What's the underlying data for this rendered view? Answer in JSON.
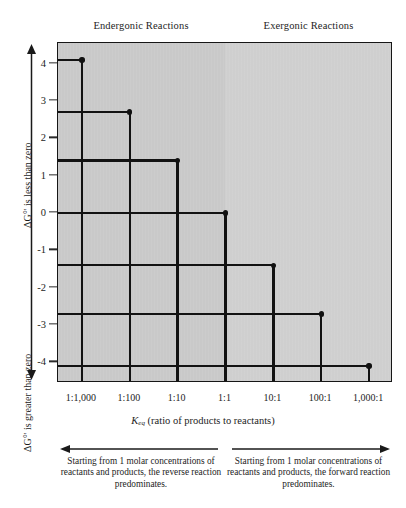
{
  "figure": {
    "region_headers": {
      "left": "Endergonic Reactions",
      "right": "Exergonic Reactions"
    },
    "y_axis": {
      "caption_upper": "ΔG°' is less than zero",
      "caption_lower": "ΔG°' is greater than zero"
    },
    "x_axis": {
      "title_symbol": "K",
      "title_subscript": "eq",
      "title_rest": " (ratio of products to reactants)"
    },
    "bottom_captions": {
      "left": "Starting from 1 molar concentrations of reactants and products, the reverse reaction predominates.",
      "right": "Starting from 1 molar concentrations of reactants and products, the forward reaction predominates."
    },
    "colors": {
      "plot_fill_left": "#c9c9c9",
      "plot_fill_right": "#cfcfcf",
      "line": "#121212",
      "frame": "#161616",
      "text": "#1d1d1d"
    }
  },
  "chart_data": {
    "type": "line",
    "title": "",
    "subtitle": "",
    "xlabel": "Keq (ratio of products to reactants)",
    "ylabel": "ΔG°'",
    "grid": false,
    "legend_position": "none",
    "step_style": "staircase",
    "x_categories": [
      "1:1,000",
      "1:100",
      "1:10",
      "1:1",
      "10:1",
      "100:1",
      "1,000:1"
    ],
    "x_values_keq": [
      0.001,
      0.01,
      0.1,
      1,
      10,
      100,
      1000
    ],
    "y_tick_labels": [
      "-4",
      "-3",
      "-2",
      "-1",
      "0",
      "1",
      "2",
      "3",
      "4"
    ],
    "y_tick_values": [
      -4,
      -3,
      -2,
      -1,
      0,
      1,
      2,
      3,
      4
    ],
    "ylim": [
      4.55,
      -4.55
    ],
    "y_axis_direction": "inverted (negative at top)",
    "series": [
      {
        "name": "ΔG°'",
        "values": [
          4.1,
          2.7,
          1.4,
          0,
          -1.4,
          -2.7,
          -4.1
        ]
      }
    ],
    "annotations": [
      "Endergonic Reactions",
      "Exergonic Reactions",
      "Starting from 1 molar concentrations of reactants and products, the reverse reaction predominates.",
      "Starting from 1 molar concentrations of reactants and products, the forward reaction predominates."
    ]
  }
}
